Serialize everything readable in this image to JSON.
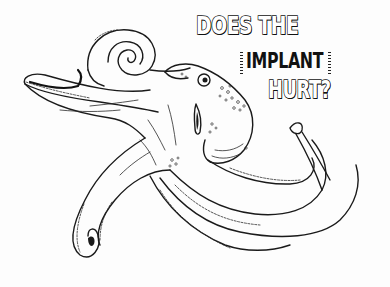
{
  "illustration": {
    "subject": "octopus line drawing",
    "style": "black ink on white",
    "ink_color": "#1a1a1a",
    "background_color": "#fdfdfd"
  },
  "caption": {
    "line1": "DOES THE",
    "line2": "IMPLANT",
    "line3": "HURT?"
  }
}
